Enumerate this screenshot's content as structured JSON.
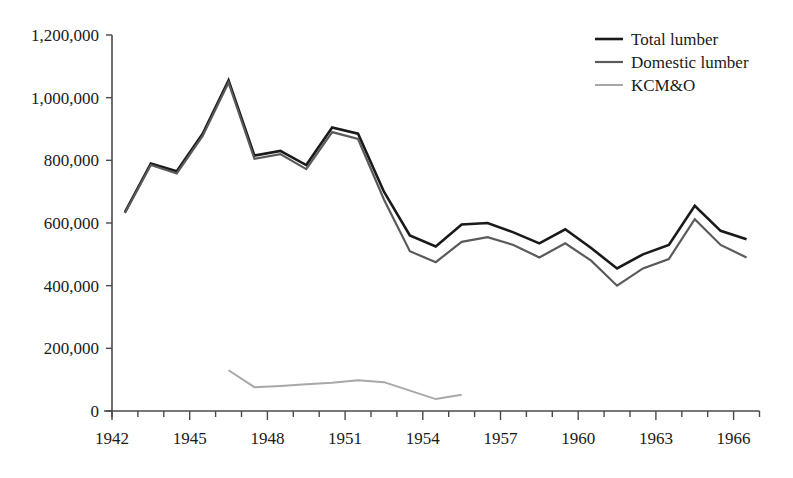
{
  "chart_data": {
    "type": "line",
    "title": "",
    "subtitle": "",
    "xlabel": "",
    "ylabel": "",
    "xlim": [
      1942,
      1967
    ],
    "ylim": [
      0,
      1200000
    ],
    "grid": false,
    "legend_position": "top-right",
    "x_tick_labels": [
      "1942",
      "1945",
      "1948",
      "1951",
      "1954",
      "1957",
      "1960",
      "1963",
      "1966"
    ],
    "x_tick_values": [
      1942,
      1945,
      1948,
      1951,
      1954,
      1957,
      1960,
      1963,
      1966
    ],
    "x_minor_ticks": [
      1943,
      1944,
      1946,
      1947,
      1949,
      1950,
      1952,
      1953,
      1955,
      1956,
      1958,
      1959,
      1961,
      1962,
      1964,
      1965,
      1967
    ],
    "y_tick_labels": [
      "0",
      "200,000",
      "400,000",
      "600,000",
      "800,000",
      "1,000,000",
      "1,200,000"
    ],
    "y_tick_values": [
      0,
      200000,
      400000,
      600000,
      800000,
      1000000,
      1200000
    ],
    "series": [
      {
        "name": "Total lumber",
        "color": "#1a1a1a",
        "width": 2.6,
        "x": [
          1942.5,
          1943.5,
          1944.5,
          1945.5,
          1946.5,
          1947.5,
          1948.5,
          1949.5,
          1950.5,
          1951.5,
          1952.5,
          1953.5,
          1954.5,
          1955.5,
          1956.5,
          1957.5,
          1958.5,
          1959.5,
          1960.5,
          1961.5,
          1962.5,
          1963.5,
          1964.5,
          1965.5,
          1966.5
        ],
        "values": [
          635000,
          790000,
          765000,
          885000,
          1055000,
          815000,
          830000,
          785000,
          905000,
          885000,
          700000,
          560000,
          525000,
          595000,
          600000,
          570000,
          535000,
          580000,
          520000,
          455000,
          500000,
          530000,
          655000,
          575000,
          548000
        ]
      },
      {
        "name": "Domestic lumber",
        "color": "#5a5a5a",
        "width": 2.2,
        "x": [
          1942.5,
          1943.5,
          1944.5,
          1945.5,
          1946.5,
          1947.5,
          1948.5,
          1949.5,
          1950.5,
          1951.5,
          1952.5,
          1953.5,
          1954.5,
          1955.5,
          1956.5,
          1957.5,
          1958.5,
          1959.5,
          1960.5,
          1961.5,
          1962.5,
          1963.5,
          1964.5,
          1965.5,
          1966.5
        ],
        "values": [
          632000,
          785000,
          758000,
          878000,
          1048000,
          805000,
          820000,
          772000,
          890000,
          868000,
          675000,
          510000,
          475000,
          540000,
          555000,
          530000,
          490000,
          535000,
          480000,
          400000,
          455000,
          485000,
          612000,
          530000,
          490000
        ]
      },
      {
        "name": "KCM&O",
        "color": "#a8a8a8",
        "width": 2.0,
        "x": [
          1946.5,
          1947.5,
          1948.5,
          1949.5,
          1950.5,
          1951.5,
          1952.5,
          1953.5,
          1954.5,
          1955.5
        ],
        "values": [
          130000,
          76000,
          80000,
          85000,
          90000,
          98000,
          92000,
          65000,
          38000,
          52000
        ]
      }
    ]
  },
  "legend": {
    "items": [
      {
        "label": "Total lumber",
        "color": "#1a1a1a"
      },
      {
        "label": "Domestic lumber",
        "color": "#5a5a5a"
      },
      {
        "label": "KCM&O",
        "color": "#a8a8a8"
      }
    ]
  }
}
